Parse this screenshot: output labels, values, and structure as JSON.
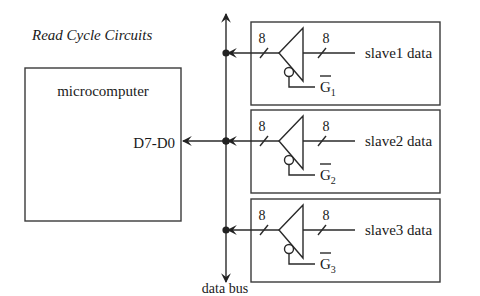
{
  "title": "Read Cycle Circuits",
  "microcomputer": {
    "label": "microcomputer",
    "port_label": "D7-D0"
  },
  "bus": {
    "label": "data bus"
  },
  "slaves": [
    {
      "data_label": "slave1 data",
      "in_width": "8",
      "out_width": "8",
      "gate_letter": "G",
      "gate_subscript": "1"
    },
    {
      "data_label": "slave2 data",
      "in_width": "8",
      "out_width": "8",
      "gate_letter": "G",
      "gate_subscript": "2"
    },
    {
      "data_label": "slave3 data",
      "in_width": "8",
      "out_width": "8",
      "gate_letter": "G",
      "gate_subscript": "3"
    }
  ]
}
